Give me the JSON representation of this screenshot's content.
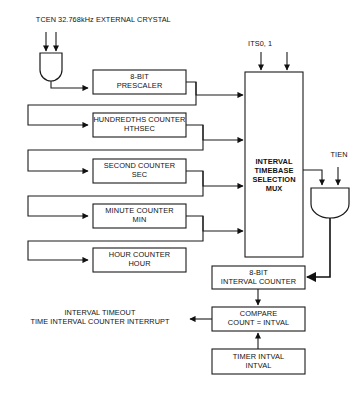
{
  "diagram": {
    "signals": {
      "tcen": "TCEN",
      "crystal": "32.768kHz EXTERNAL CRYSTAL",
      "its": "ITS0, 1",
      "tien": "TIEN"
    },
    "blocks": {
      "prescaler": {
        "line1": "8-BIT",
        "line2": "PRESCALER"
      },
      "hthsec": {
        "line1": "HUNDREDTHS COUNTER",
        "line2": "HTHSEC"
      },
      "sec": {
        "line1": "SECOND COUNTER",
        "line2": "SEC"
      },
      "min": {
        "line1": "MINUTE COUNTER",
        "line2": "MIN"
      },
      "hour": {
        "line1": "HOUR COUNTER",
        "line2": "HOUR"
      },
      "mux": {
        "line1": "INTERVAL",
        "line2": "TIMEBASE",
        "line3": "SELECTION",
        "line4": "MUX"
      },
      "interval_counter": {
        "line1": "8-BIT",
        "line2": "INTERVAL COUNTER"
      },
      "compare": {
        "line1": "COMPARE",
        "line2": "COUNT = INTVAL"
      },
      "intval": {
        "line1": "TIMER INTVAL",
        "line2": "INTVAL"
      }
    },
    "outputs": {
      "interrupt_line1": "INTERVAL TIMEOUT",
      "interrupt_line2": "TIME INTERVAL COUNTER INTERRUPT"
    },
    "colors": {
      "line": "#1a1a1a",
      "background": "#ffffff",
      "text": "#111111"
    }
  }
}
